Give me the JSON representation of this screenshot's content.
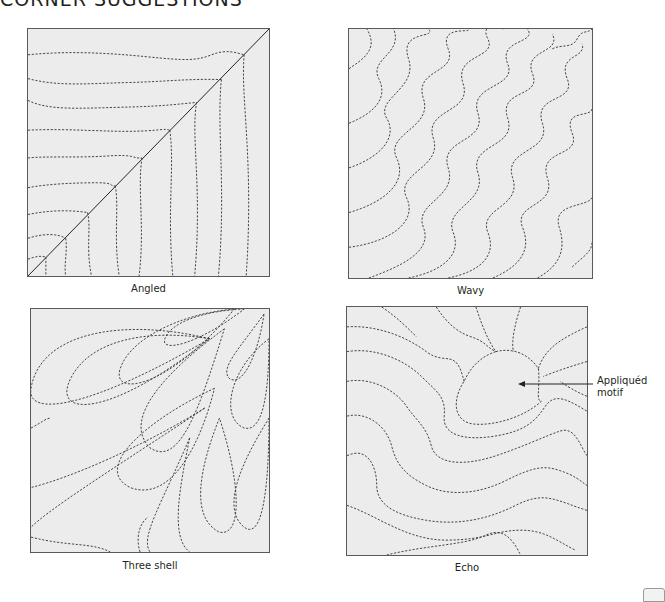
{
  "page": {
    "title": "CORNER SUGGESTIONS"
  },
  "panels": [
    {
      "id": "angled",
      "caption": "Angled"
    },
    {
      "id": "wavy",
      "caption": "Wavy"
    },
    {
      "id": "three-shell",
      "caption": "Three shell"
    },
    {
      "id": "echo",
      "caption": "Echo"
    }
  ],
  "annotation": {
    "line1": "Appliquéd",
    "line2": "motif"
  },
  "colors": {
    "panel_fill": "#ececec",
    "panel_border": "#5a5a5a",
    "stitch": "#333333",
    "text": "#231f20"
  }
}
